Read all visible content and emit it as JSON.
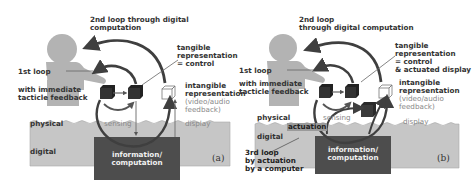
{
  "colors": {
    "digital_bg": "#c6c6c6",
    "person": "#b3b3b3",
    "computation_box": "#4d4d4d",
    "arrows": "#3f3f3f",
    "cube": "#333333",
    "text": "#333333"
  },
  "panel_a": {
    "loop2_line1": "2nd loop through digital",
    "loop2_line2": "computation",
    "tangible_line1": "tangible",
    "tangible_line2": "representation",
    "tangible_line3": "= control",
    "loop1": "1st loop",
    "immediate_line1": "with immediate",
    "immediate_line2": "tacticle feedback",
    "intangible_line1": "intangible",
    "intangible_line2": "representation",
    "intangible_line3": "(video/audio",
    "intangible_line4": "feedback)",
    "physical": "physical",
    "sensing": "sensing",
    "display": "display",
    "digital": "digital",
    "computation_line1": "information/",
    "computation_line2": "computation",
    "panel_label": "(a)"
  },
  "panel_b": {
    "loop2_line1": "2nd loop",
    "loop2_line2": "through digital computation",
    "tangible_line1": "tangible",
    "tangible_line2": "representation",
    "tangible_line3": "= control",
    "tangible_line4": "& actuated display",
    "loop1": "1st loop",
    "immediate_line1": "with immediate",
    "immediate_line2": "tacticle feedback",
    "intangible_line1": "intangible",
    "intangible_line2": "representation",
    "intangible_line3": "(video/audio",
    "intangible_line4": "feedback)",
    "physical": "physical",
    "sensing": "sensing",
    "display": "display",
    "actuation": "actuation",
    "digital": "digital",
    "loop3_line1": "3rd loop",
    "loop3_line2": "by actuation",
    "loop3_line3": "by a computer",
    "computation_line1": "information/",
    "computation_line2": "computation",
    "panel_label": "(b)"
  }
}
